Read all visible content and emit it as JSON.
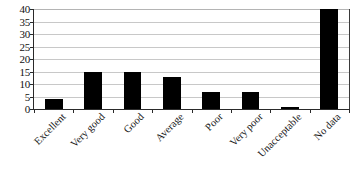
{
  "chart_data": {
    "type": "bar",
    "title": "",
    "subtitle": "",
    "xlabel": "",
    "ylabel": "",
    "categories": [
      "Excellent",
      "Very good",
      "Good",
      "Average",
      "Poor",
      "Very poor",
      "Unacceptable",
      "No data"
    ],
    "values": [
      4,
      15,
      15,
      13,
      7,
      7,
      1,
      40
    ],
    "ylim": [
      0,
      40
    ],
    "ytick_labels": [
      "0",
      "5",
      "10",
      "15",
      "20",
      "25",
      "30",
      "35",
      "40"
    ],
    "ytick_values": [
      0,
      5,
      10,
      15,
      20,
      25,
      30,
      35,
      40
    ],
    "grid": "horizontal",
    "legend": "none",
    "bar_color": "#000000",
    "grid_color": "#c8c8c8",
    "axis_color": "#2a2a2a",
    "background_color": "#ffffff",
    "xtick_label_rotation": -45
  }
}
